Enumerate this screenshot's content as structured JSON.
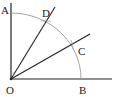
{
  "diagram": {
    "type": "angle-trisection-construction",
    "points": {
      "O": {
        "label": "O",
        "x": 11,
        "y": 79
      },
      "A": {
        "label": "A",
        "x": 11,
        "y": 13
      },
      "B": {
        "label": "B",
        "x": 81,
        "y": 79
      },
      "C": {
        "label": "C",
        "x": 72,
        "y": 44
      },
      "D": {
        "label": "D",
        "x": 45,
        "y": 21
      }
    },
    "colors": {
      "line": "#222222",
      "arc": "#9a9a9a"
    }
  }
}
